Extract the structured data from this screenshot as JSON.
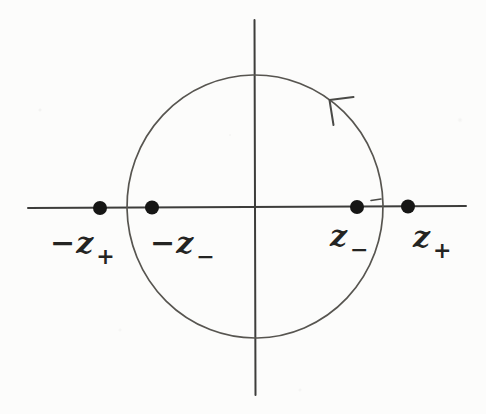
{
  "figure": {
    "axis_points": [
      {
        "name": "neg-z-plus",
        "base": "−z",
        "sub": "+"
      },
      {
        "name": "neg-z-minus",
        "base": "−z",
        "sub": "−"
      },
      {
        "name": "z-minus",
        "base": "z",
        "sub": "−"
      },
      {
        "name": "z-plus",
        "base": "z",
        "sub": "+"
      }
    ]
  },
  "colors": {
    "axis_ink": "#3d3d3b",
    "circle_ink": "#575550",
    "arrow_ink": "#4a4a47",
    "dot_ink": "#161615",
    "background": "#fcfcfb"
  }
}
